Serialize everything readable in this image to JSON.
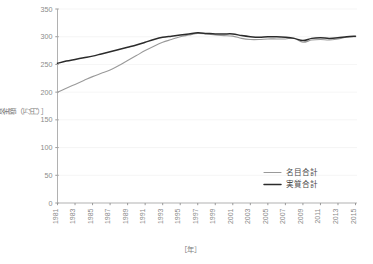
{
  "chart_data": {
    "type": "line",
    "title": "",
    "subtitle": "",
    "xlabel": "［年］",
    "ylabel": "［賃金額（万円）］",
    "xlim": [
      1981,
      2015
    ],
    "ylim": [
      0,
      350
    ],
    "ytick_values": [
      0,
      50,
      100,
      150,
      200,
      250,
      300,
      350
    ],
    "ytick_labels": [
      "0",
      "50",
      "100",
      "150",
      "200",
      "250",
      "300",
      "350"
    ],
    "xtick_values": [
      1981,
      1983,
      1985,
      1987,
      1989,
      1991,
      1993,
      1995,
      1997,
      1999,
      2001,
      2003,
      2005,
      2007,
      2009,
      2011,
      2013,
      2015
    ],
    "xtick_labels": [
      "1981",
      "1983",
      "1985",
      "1987",
      "1989",
      "1991",
      "1993",
      "1995",
      "1997",
      "1999",
      "2001",
      "2003",
      "2005",
      "2007",
      "2009",
      "2011",
      "2013",
      "2015"
    ],
    "grid": true,
    "grid_axis": "y",
    "legend_position": "inside-lower-right",
    "x": [
      1981,
      1982,
      1983,
      1984,
      1985,
      1986,
      1987,
      1988,
      1989,
      1990,
      1991,
      1992,
      1993,
      1994,
      1995,
      1996,
      1997,
      1998,
      1999,
      2000,
      2001,
      2002,
      2003,
      2004,
      2005,
      2006,
      2007,
      2008,
      2009,
      2010,
      2011,
      2012,
      2013,
      2014,
      2015
    ],
    "series": [
      {
        "name": "名目合計",
        "color": "#9a9a9a",
        "width": 1.1,
        "values": [
          200,
          207,
          214,
          221,
          228,
          234,
          240,
          248,
          257,
          266,
          275,
          283,
          290,
          295,
          300,
          303,
          306,
          305,
          303,
          302,
          301,
          297,
          295,
          295,
          296,
          296,
          296,
          297,
          290,
          294,
          295,
          294,
          296,
          299,
          300
        ]
      },
      {
        "name": "実質合計",
        "color": "#2b2b2b",
        "width": 1.5,
        "values": [
          252,
          256,
          259,
          262,
          265,
          269,
          273,
          277,
          281,
          285,
          290,
          295,
          299,
          301,
          303,
          305,
          307,
          306,
          305,
          305,
          305,
          302,
          300,
          299,
          300,
          300,
          299,
          297,
          293,
          297,
          298,
          297,
          298,
          300,
          301
        ]
      }
    ]
  },
  "legend": {
    "items": [
      {
        "label": "名目合計",
        "color": "#9a9a9a",
        "width": 1.1
      },
      {
        "label": "実質合計",
        "color": "#2b2b2b",
        "width": 1.5
      }
    ]
  }
}
